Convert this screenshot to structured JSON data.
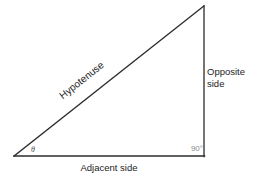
{
  "figure": {
    "type": "right-triangle-trigonometry-diagram",
    "background_color": "#ffffff",
    "stroke_color": "#2b2b2b",
    "labels": {
      "hypotenuse": "Hypotenuse",
      "opposite_line1": "Opposite",
      "opposite_line2": "side",
      "adjacent": "Adjacent side",
      "theta": "θ",
      "right_angle": "90°"
    },
    "label_colors": {
      "text": "#1d1d1d",
      "theta": "#555555",
      "right_angle": "#8a8a8a"
    },
    "geometry": {
      "left_vertex": [
        14,
        156
      ],
      "right_angle_vertex": [
        204,
        156
      ],
      "apex": [
        204,
        6
      ],
      "adjacent_length_px": 190,
      "opposite_length_px": 150,
      "hypotenuse_angle_deg": -38.3
    }
  }
}
